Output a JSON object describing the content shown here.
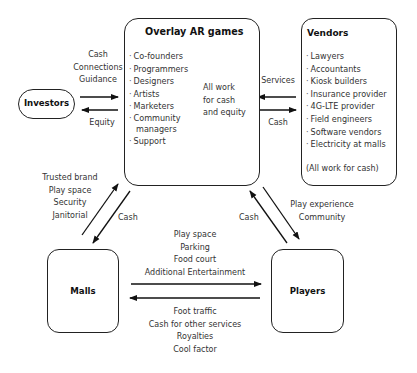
{
  "nodes": {
    "overlay": {
      "title": "Overlay AR games",
      "members": [
        "Co-founders",
        "Programmers",
        "Designers",
        "Artists",
        "Marketers",
        "Community",
        "managers",
        "Support"
      ],
      "bracket_note": [
        "All work",
        "for cash",
        "and equity"
      ]
    },
    "vendors": {
      "title": "Vendors",
      "members": [
        "Lawyers",
        "Accountants",
        "Kiosk builders",
        "Insurance provider",
        "4G-LTE provider",
        "Field engineers",
        "Software vendors",
        "Electricity at malls"
      ],
      "note": "(All work for cash)"
    },
    "investors": {
      "title": "Investors"
    },
    "malls": {
      "title": "Malls"
    },
    "players": {
      "title": "Players"
    }
  },
  "flows": {
    "investors_to_overlay": [
      "Cash",
      "Connections",
      "Guidance"
    ],
    "overlay_to_investors": [
      "Equity"
    ],
    "vendors_to_overlay": [
      "Services"
    ],
    "overlay_to_vendors": [
      "Cash"
    ],
    "malls_to_overlay": [
      "Trusted brand",
      "Play space",
      "Security",
      "Janitorial"
    ],
    "overlay_to_malls": [
      "Cash"
    ],
    "players_to_overlay": [
      "Cash"
    ],
    "overlay_to_players": [
      "Play experience",
      "Community"
    ],
    "malls_to_players": [
      "Play space",
      "Parking",
      "Food court",
      "Additional Entertainment"
    ],
    "players_to_malls": [
      "Foot traffic",
      "Cash for other services",
      "Royalties",
      "Cool factor"
    ]
  }
}
